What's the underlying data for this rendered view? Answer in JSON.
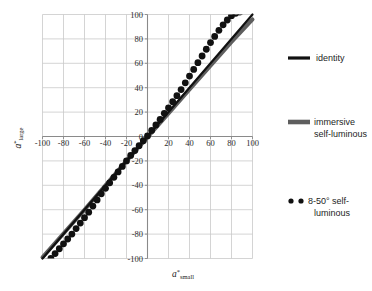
{
  "chart_data": {
    "type": "scatter",
    "title": "",
    "xlabel": "a*small",
    "ylabel": "a*large",
    "xlabel_parts": {
      "symbol": "a",
      "sup": "*",
      "sub": "small"
    },
    "ylabel_parts": {
      "symbol": "a",
      "sup": "*",
      "sub": "large"
    },
    "xlim": [
      -100,
      100
    ],
    "ylim": [
      -100,
      100
    ],
    "xticks": [
      -100,
      -80,
      -60,
      -40,
      -20,
      0,
      20,
      40,
      60,
      80,
      100
    ],
    "yticks": [
      -100,
      -80,
      -60,
      -40,
      -20,
      0,
      20,
      40,
      60,
      80,
      100
    ],
    "xtick_labels": [
      "-100",
      "-80",
      "-60",
      "-40",
      "-20",
      "0",
      "20",
      "40",
      "60",
      "80",
      "100"
    ],
    "ytick_labels": [
      "-100",
      "-80",
      "-60",
      "-40",
      "-20",
      "0",
      "20",
      "40",
      "60",
      "80",
      "100"
    ],
    "grid": true,
    "grid_color": "#c9c9c9",
    "axis_position": "zero",
    "legend_position": "right",
    "series": [
      {
        "name": "identity",
        "type": "line",
        "color": "#111111",
        "linewidth": 2.2,
        "x": [
          -100,
          100
        ],
        "values": [
          -100,
          100
        ]
      },
      {
        "name": "immersive self-luminous",
        "type": "line",
        "color": "#5e5e5e",
        "linewidth": 4.0,
        "x": [
          -100,
          -80,
          -60,
          -40,
          -20,
          0,
          20,
          40,
          60,
          80,
          100
        ],
        "values": [
          -99,
          -79.5,
          -60,
          -40,
          -20,
          -0.5,
          19,
          38.5,
          58,
          77.5,
          96
        ]
      },
      {
        "name": "8-50° self-luminous",
        "type": "scatter",
        "color": "#111111",
        "marker": "circle",
        "markersize": 3.4,
        "x": [
          -96,
          -92,
          -88,
          -84,
          -80,
          -76,
          -72,
          -68,
          -64,
          -60,
          -56,
          -52,
          -48,
          -44,
          -40,
          -36,
          -32,
          -28,
          -24,
          -20,
          -16,
          -12,
          -8,
          -4,
          0,
          4,
          8,
          12,
          16,
          20,
          24,
          28,
          32,
          36,
          40,
          44,
          48,
          52,
          56,
          60,
          64,
          68,
          72,
          76,
          80,
          84,
          88
        ],
        "values": [
          -103,
          -100,
          -96,
          -92,
          -88,
          -84,
          -80,
          -75.5,
          -71,
          -66.5,
          -62,
          -57,
          -52,
          -47,
          -42.5,
          -38,
          -33.5,
          -29,
          -24.5,
          -20,
          -15.5,
          -11.5,
          -7.5,
          -3.5,
          0.5,
          5,
          9.5,
          14,
          19,
          23.5,
          28.5,
          33.5,
          38.5,
          44,
          49.5,
          55,
          60.5,
          66,
          71.5,
          77,
          82,
          87,
          91.5,
          95.5,
          99,
          101,
          102
        ]
      }
    ]
  },
  "legend": {
    "items": [
      {
        "label": "identity",
        "marker": "line-thin-black"
      },
      {
        "label": "immersive self-luminous",
        "label_line1": "immersive",
        "label_line2": "self-luminous",
        "marker": "line-thick-gray"
      },
      {
        "label": "8-50° self-luminous",
        "label_line1": "8-50° self-",
        "label_line2": "luminous",
        "marker": "dots-black"
      }
    ]
  },
  "colors": {
    "identity": "#111111",
    "immersive": "#5e5e5e",
    "dots": "#111111",
    "grid": "#c9c9c9",
    "axis": "#8a8a8a",
    "text": "#1d1d1d",
    "background": "#ffffff"
  }
}
